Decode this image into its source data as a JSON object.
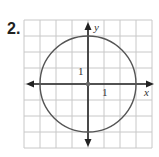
{
  "problem": {
    "number": "2."
  },
  "graph": {
    "x_axis_label": "x",
    "y_axis_label": "y",
    "x_tick_label": "1",
    "y_tick_label": "1",
    "grid_units": 8,
    "circle": {
      "center": [
        0,
        0
      ],
      "radius": 3
    },
    "colors": {
      "grid": "#c8c8c8",
      "axis": "#222222",
      "circle": "#555555"
    }
  }
}
